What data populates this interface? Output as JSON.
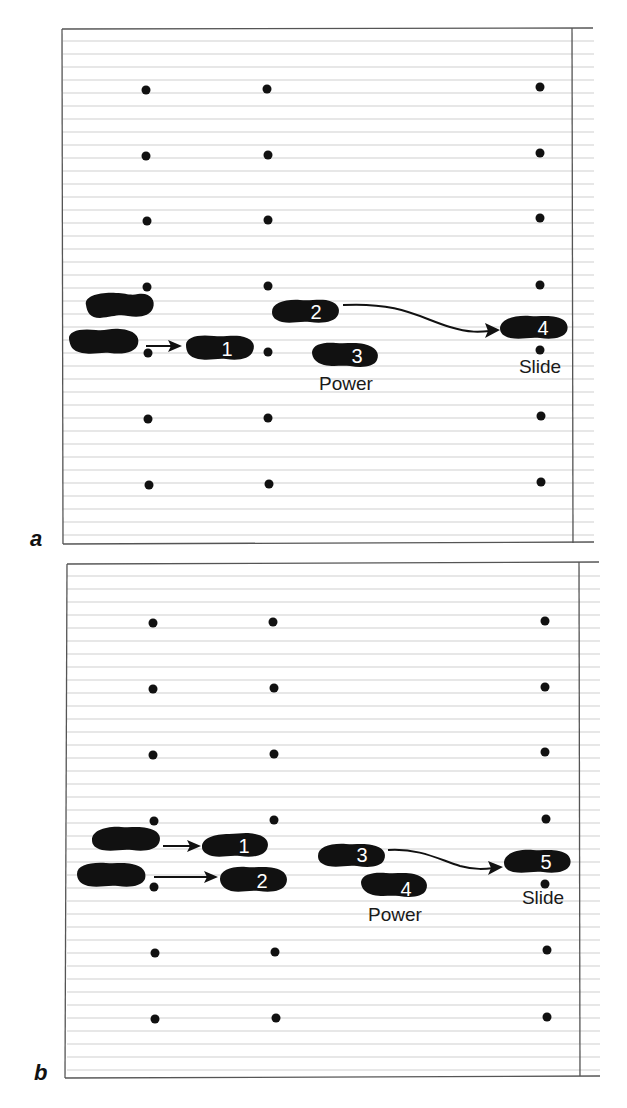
{
  "figure": {
    "colors": {
      "ink": "#111111",
      "rule": "#c8c8c8",
      "border": "#555555"
    },
    "panels": [
      {
        "id": "a",
        "label": "a",
        "steps": [
          {
            "number": "1"
          },
          {
            "number": "2"
          },
          {
            "number": "3"
          },
          {
            "number": "4"
          }
        ],
        "captions": {
          "power": "Power",
          "slide": "Slide"
        }
      },
      {
        "id": "b",
        "label": "b",
        "steps": [
          {
            "number": "1"
          },
          {
            "number": "2"
          },
          {
            "number": "3"
          },
          {
            "number": "4"
          },
          {
            "number": "5"
          }
        ],
        "captions": {
          "power": "Power",
          "slide": "Slide"
        }
      }
    ]
  }
}
